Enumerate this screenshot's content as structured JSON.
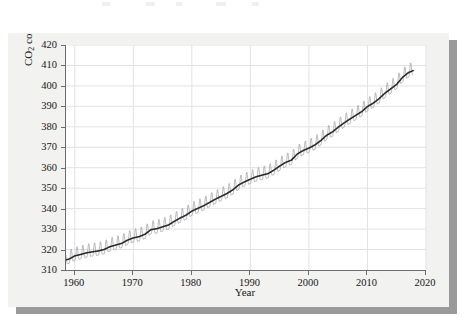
{
  "figure": {
    "background_color": "#f2f2f0",
    "shadow_color": "#9a9a9d",
    "plot_background": "#ffffff",
    "axis_color": "#6d6d70",
    "grid_color": "#e2e2e6"
  },
  "chart_data": {
    "type": "line",
    "title": "",
    "xlabel": "Year",
    "ylabel": "CO2 concentration (ppm by volume)",
    "ylabel_parts": {
      "prefix": "CO",
      "subscript": "2",
      "suffix": " concentration (ppm by volume)"
    },
    "xlim": [
      1958.5,
      2020
    ],
    "ylim": [
      310,
      420
    ],
    "xticks": [
      1960,
      1970,
      1980,
      1990,
      2000,
      2010,
      2020
    ],
    "xtick_labels": [
      "1960",
      "1970",
      "1980",
      "1990",
      "2000",
      "2010",
      "2020"
    ],
    "yticks": [
      310,
      320,
      330,
      340,
      350,
      360,
      370,
      380,
      390,
      400,
      410,
      420
    ],
    "ytick_labels": [
      "310",
      "320",
      "330",
      "340",
      "350",
      "360",
      "370",
      "380",
      "390",
      "400",
      "410",
      "420"
    ],
    "grid": true,
    "legend": null,
    "annotations": [],
    "series": [
      {
        "name": "Monthly mean CO2 (seasonal cycle)",
        "color": "#9b9b9e",
        "line_width": 0.7,
        "description": "Monthly Mauna Loa record showing annual sawtooth oscillation of about +/-3 ppm around the trend",
        "seasonal_amplitude_ppm": 3.1
      },
      {
        "name": "Smoothed trend",
        "color": "#2b2b2b",
        "line_width": 1.6,
        "x": [
          1958.5,
          1959,
          1960,
          1961,
          1962,
          1963,
          1964,
          1965,
          1966,
          1967,
          1968,
          1969,
          1970,
          1971,
          1972,
          1973,
          1974,
          1975,
          1976,
          1977,
          1978,
          1979,
          1980,
          1981,
          1982,
          1983,
          1984,
          1985,
          1986,
          1987,
          1988,
          1989,
          1990,
          1991,
          1992,
          1993,
          1994,
          1995,
          1996,
          1997,
          1998,
          1999,
          2000,
          2001,
          2002,
          2003,
          2004,
          2005,
          2006,
          2007,
          2008,
          2009,
          2010,
          2011,
          2012,
          2013,
          2014,
          2015,
          2016,
          2017,
          2017.8
        ],
        "values": [
          315.0,
          315.3,
          316.9,
          317.6,
          318.4,
          318.9,
          319.3,
          320.0,
          321.4,
          322.2,
          323.0,
          324.6,
          325.7,
          326.3,
          327.5,
          329.7,
          330.2,
          331.1,
          332.0,
          333.8,
          335.4,
          336.8,
          338.8,
          340.1,
          341.4,
          343.0,
          344.6,
          346.0,
          347.4,
          349.2,
          351.6,
          353.1,
          354.4,
          355.6,
          356.4,
          357.1,
          358.8,
          360.8,
          362.6,
          363.7,
          366.7,
          368.4,
          369.6,
          371.1,
          373.2,
          375.8,
          377.5,
          379.8,
          381.9,
          383.8,
          385.6,
          387.4,
          389.9,
          391.6,
          393.8,
          396.5,
          398.6,
          400.8,
          404.2,
          406.5,
          407.5
        ]
      }
    ]
  }
}
